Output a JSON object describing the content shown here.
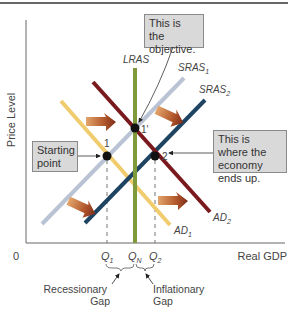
{
  "axes": {
    "y_label": "Price Level",
    "x_label": "Real GDP",
    "origin_label": "0"
  },
  "curves": {
    "lras": {
      "label": "LRAS",
      "color": "#7f9a3a"
    },
    "sras1": {
      "label": "SRAS",
      "sub": "1",
      "color": "#b9c3d3"
    },
    "sras2": {
      "label": "SRAS",
      "sub": "2",
      "color": "#1f4461"
    },
    "ad1": {
      "label": "AD",
      "sub": "1",
      "color": "#f0cc6e"
    },
    "ad2": {
      "label": "AD",
      "sub": "2",
      "color": "#7a1a1e"
    }
  },
  "points": {
    "p1": {
      "label": "1"
    },
    "p1prime": {
      "label": "1'"
    },
    "p2": {
      "label": "2"
    }
  },
  "ticks": {
    "q1": {
      "label": "Q",
      "sub": "1"
    },
    "qn": {
      "label": "Q",
      "sub": "N"
    },
    "q2": {
      "label": "Q",
      "sub": "2"
    }
  },
  "gaps": {
    "recessionary": {
      "line1": "Recessionary",
      "line2": "Gap"
    },
    "inflationary": {
      "line1": "Inflationary",
      "line2": "Gap"
    }
  },
  "callouts": {
    "objective": "This is the objective.",
    "starting": "Starting point",
    "ends_up": "This is where the economy ends up."
  },
  "colors": {
    "shift_arrow": "#a9542a",
    "axis": "#555555",
    "callout_bg": "#d9d9d9"
  }
}
